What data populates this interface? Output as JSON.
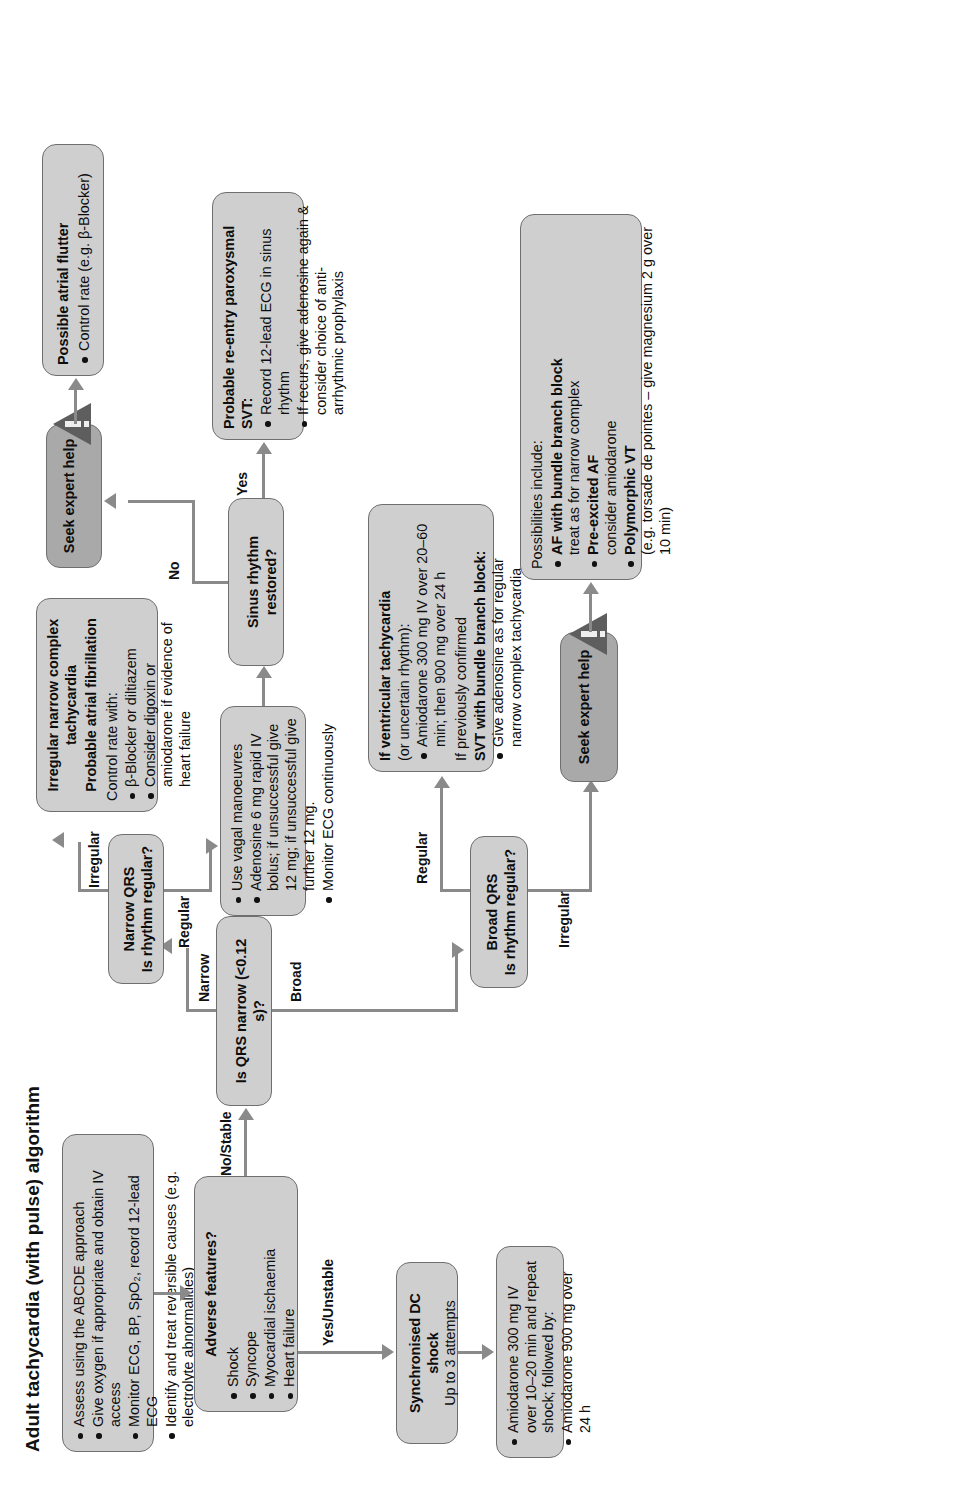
{
  "title": "Adult tachycardia (with pulse) algorithm",
  "nodes": {
    "initial_assessment": {
      "name": "initial-assessment",
      "bullets": [
        "Assess using the ABCDE approach",
        "Give oxygen if appropriate and obtain IV access",
        "Monitor ECG, BP, SpO₂, record 12-lead ECG",
        "Identify and treat reversible causes (e.g. electrolyte abnormalities)"
      ]
    },
    "adverse_features": {
      "heading": "Adverse features?",
      "bullets": [
        "Shock",
        "Syncope",
        "Myocardial ischaemia",
        "Heart failure"
      ]
    },
    "dc_shock": {
      "heading": "Synchronised DC shock",
      "sub": "Up to 3 attempts"
    },
    "amiodarone": {
      "bullets": [
        "Amiodarone 300 mg IV over 10–20 min and repeat shock; followed by:",
        "Amiodarone 900 mg over 24 h"
      ]
    },
    "qrs_narrow": {
      "heading": "Is QRS narrow (<0.12 s)?"
    },
    "narrow_qrs_regular": {
      "line1": "Narrow QRS",
      "line2": "Is rhythm regular?"
    },
    "broad_qrs_regular": {
      "line1": "Broad QRS",
      "line2": "Is rhythm regular?"
    },
    "vagal_adenosine": {
      "bullets": [
        "Use vagal manoeuvres",
        "Adenosine 6 mg rapid IV bolus; if unsuccessful give 12 mg; if unsuccessful give further 12 mg.",
        "Monitor ECG continuously"
      ]
    },
    "sinus_restored": {
      "heading": "Sinus rhythm restored?"
    },
    "svt_reentry": {
      "heading": "Probable re-entry paroxysmal SVT:",
      "bullets": [
        "Record 12-lead ECG in sinus rhythm",
        "If recurs, give adenosine again & consider choice of anti-arrhythmic prophylaxis"
      ]
    },
    "irregular_narrow": {
      "heading": "Irregular narrow complex tachycardia",
      "sub": "Probable atrial fibrillation",
      "lead": "Control rate with:",
      "bullets": [
        "β-Blocker or diltiazem",
        "Consider digoxin or amiodarone if evidence of heart failure"
      ]
    },
    "atrial_flutter": {
      "heading": "Possible atrial flutter",
      "bullets": [
        "Control rate (e.g. β-Blocker)"
      ]
    },
    "seek_help_top": {
      "label": "Seek expert help",
      "icon": "warning-triangle-icon"
    },
    "seek_help_bottom": {
      "label": "Seek expert help",
      "icon": "warning-triangle-icon"
    },
    "vt_box": {
      "lead_bold": "If ventricular tachycardia",
      "lead_rest": "(or uncertain rhythm):",
      "bullets": [
        "Amiodarone 300 mg IV over 20–60 min; then 900 mg over 24 h"
      ],
      "mid": "If previously confirmed",
      "mid_bold": "SVT with bundle branch block:",
      "bullets2": [
        "Give adenosine as for regular narrow complex tachycardia"
      ]
    },
    "possibilities": {
      "lead": "Possibilities include:",
      "items": [
        {
          "bold": "AF with bundle branch block",
          "rest": "treat as for narrow complex"
        },
        {
          "bold": "Pre-excited AF",
          "rest": "consider amiodarone"
        },
        {
          "bold": "Polymorphic VT",
          "rest": "(e.g. torsade de pointes – give magnesium 2 g over 10 min)"
        }
      ]
    }
  },
  "edge_labels": {
    "yes_unstable": "Yes/Unstable",
    "no_stable": "No/Stable",
    "narrow": "Narrow",
    "broad": "Broad",
    "regular_narrow": "Regular",
    "irregular_narrow": "Irregular",
    "regular_broad": "Regular",
    "irregular_broad": "Irregular",
    "yes": "Yes",
    "no": "No"
  },
  "colors": {
    "box_fill": "#cfcfcf",
    "box_fill_dark": "#a9a9a9",
    "box_border": "#6f6f6f",
    "connector": "#8a8a8a",
    "text": "#111111"
  }
}
